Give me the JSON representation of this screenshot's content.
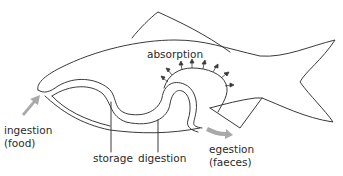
{
  "diagram": {
    "labels": {
      "absorption": "absorption",
      "ingestion_line1": "ingestion",
      "ingestion_line2": "(food)",
      "storage": "storage",
      "digestion": "digestion",
      "egestion_line1": "egestion",
      "egestion_line2": "(faeces)"
    },
    "colors": {
      "outline": "#3a3a3a",
      "arrow": "#a9a9a9",
      "text": "#2a2a2a"
    }
  }
}
